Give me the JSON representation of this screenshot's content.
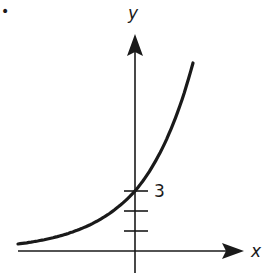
{
  "chart_data": {
    "type": "line",
    "title": "",
    "xlabel": "x",
    "ylabel": "y",
    "function": "y = 3 * b^x (exponential growth, b > 1)",
    "y_intercept": 3,
    "y_intercept_label": "3",
    "y_ticks": [
      1,
      2,
      3
    ],
    "x_ticks": [],
    "xlim": [
      -5.9,
      6.0
    ],
    "ylim": [
      -1.1,
      12.5
    ],
    "grid": false,
    "legend": null,
    "series": [
      {
        "name": "exponential curve",
        "x": [
          -5.85,
          -5,
          -4,
          -3,
          -2,
          -1,
          0,
          1,
          2,
          2.9
        ],
        "values": [
          0.35,
          0.47,
          0.68,
          0.99,
          1.43,
          2.07,
          3.0,
          4.35,
          6.31,
          9.4
        ]
      }
    ],
    "annotations": [
      {
        "text": "•",
        "position": "top-left corner mark"
      }
    ]
  },
  "labels": {
    "x_axis": "x",
    "y_axis": "y",
    "intercept": "3",
    "corner_mark": "•"
  },
  "colors": {
    "ink": "#1a1a1a",
    "background": "#ffffff"
  }
}
